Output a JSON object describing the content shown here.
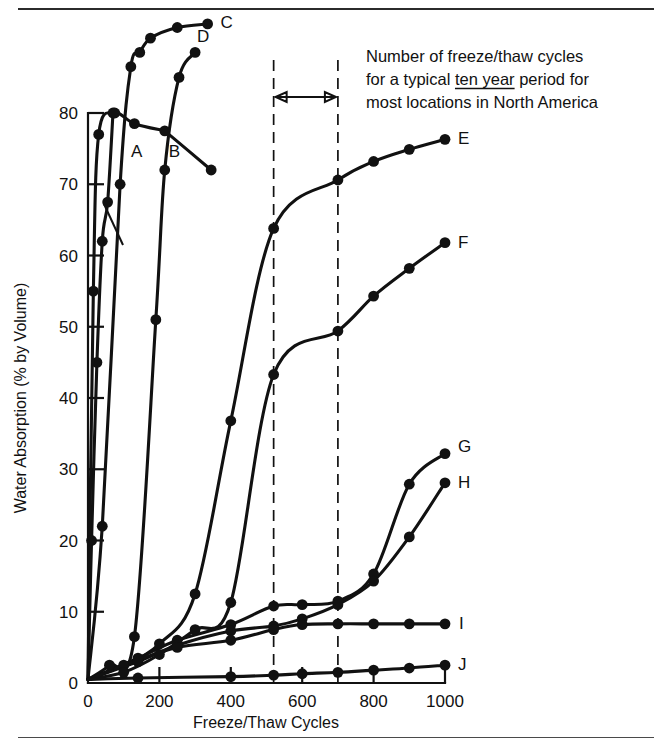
{
  "figure": {
    "annotation": {
      "line1": "Number of freeze/thaw cycles",
      "line2_pre": "for a typical ",
      "line2_underlined": "ten year",
      "line2_post": " period for",
      "line3": "most locations in North America"
    },
    "span_marker": {
      "start_cycles": 520,
      "end_cycles": 700
    }
  },
  "chart_data": {
    "type": "line",
    "title": "",
    "xlabel": "Freeze/Thaw Cycles",
    "ylabel": "Water Absorption (% by Volume)",
    "xlim": [
      0,
      1000
    ],
    "ylim": [
      0,
      80
    ],
    "xticks": [
      0,
      200,
      400,
      600,
      800,
      1000
    ],
    "yticks": [
      0,
      10,
      20,
      30,
      40,
      50,
      60,
      70,
      80
    ],
    "xticklabels": [
      "0",
      "200",
      "400",
      "600",
      "800",
      "1000"
    ],
    "yticklabels": [
      "0",
      "10",
      "20",
      "30",
      "40",
      "50",
      "60",
      "70",
      "80"
    ],
    "grid": false,
    "legend": "inline-end-labels",
    "series": [
      {
        "name": "A",
        "label": "A",
        "x": [
          0,
          10,
          25,
          40,
          55,
          70
        ],
        "y": [
          0.5,
          20,
          45,
          62,
          67.5,
          80
        ]
      },
      {
        "name": "B",
        "label": "B",
        "x": [
          0,
          15,
          30,
          75,
          130,
          215
        ],
        "y": [
          0.5,
          55,
          77.0,
          80.0,
          78.5,
          77.5
        ]
      },
      {
        "name": "B2",
        "label": "",
        "x": [
          215,
          345
        ],
        "y": [
          77.5,
          72.0
        ]
      },
      {
        "name": "C",
        "label": "C",
        "x": [
          0,
          40,
          90,
          120,
          145,
          175,
          250,
          335
        ],
        "y": [
          0.5,
          22,
          70,
          86.5,
          88.5,
          90.5,
          92.0,
          92.5
        ]
      },
      {
        "name": "D",
        "label": "D",
        "x": [
          0,
          60,
          130,
          190,
          215,
          255,
          300
        ],
        "y": [
          0.5,
          2.5,
          6.5,
          51.0,
          72,
          85,
          88.5
        ]
      },
      {
        "name": "E",
        "label": "E",
        "x": [
          0,
          100,
          200,
          300,
          400,
          520,
          700,
          800,
          900,
          1000
        ],
        "y": [
          0.5,
          2.5,
          5.5,
          12.5,
          36.8,
          63.8,
          70.6,
          73.2,
          74.9,
          76.3
        ]
      },
      {
        "name": "F",
        "label": "F",
        "x": [
          0,
          100,
          200,
          300,
          400,
          520,
          700,
          800,
          900,
          1000
        ],
        "y": [
          0.5,
          1.5,
          4.0,
          7.5,
          11.3,
          43.3,
          49.4,
          54.3,
          58.2,
          61.8
        ]
      },
      {
        "name": "G",
        "label": "G",
        "x": [
          0,
          140,
          250,
          400,
          520,
          600,
          700,
          800,
          900,
          1000
        ],
        "y": [
          0.5,
          3.5,
          6.0,
          8.2,
          10.8,
          11.0,
          11.5,
          15.3,
          27.9,
          32.2
        ]
      },
      {
        "name": "H",
        "label": "H",
        "x": [
          0,
          140,
          250,
          400,
          520,
          600,
          700,
          800,
          900,
          1000
        ],
        "y": [
          0.5,
          3.0,
          5.3,
          7.3,
          8.0,
          9.0,
          11.0,
          14.3,
          20.5,
          28.1
        ]
      },
      {
        "name": "I",
        "label": "I",
        "x": [
          0,
          140,
          250,
          400,
          520,
          600,
          700,
          800,
          900,
          1000
        ],
        "y": [
          0.5,
          3.2,
          5.0,
          6.0,
          7.5,
          8.2,
          8.3,
          8.3,
          8.3,
          8.3
        ]
      },
      {
        "name": "J",
        "label": "J",
        "x": [
          0,
          140,
          400,
          520,
          600,
          700,
          800,
          900,
          1000
        ],
        "y": [
          0.5,
          0.7,
          0.9,
          1.1,
          1.3,
          1.5,
          1.8,
          2.1,
          2.5
        ]
      }
    ]
  }
}
